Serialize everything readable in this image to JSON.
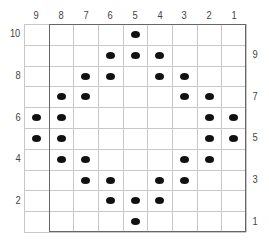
{
  "grid": {
    "rows": 10,
    "cols": 9,
    "column_labels": [
      "9",
      "8",
      "7",
      "6",
      "5",
      "4",
      "3",
      "2",
      "1"
    ],
    "row_labels_left": [
      "10",
      "8",
      "6",
      "4",
      "2"
    ],
    "row_labels_right": [
      "9",
      "7",
      "5",
      "3",
      "1"
    ],
    "dot_color": "#111111",
    "line_color": "#c8c8c8",
    "frame_color": "#666666"
  },
  "dots": [
    {
      "row": 10,
      "cols": [
        "5"
      ]
    },
    {
      "row": 9,
      "cols": [
        "6",
        "5",
        "4"
      ]
    },
    {
      "row": 8,
      "cols": [
        "7",
        "6",
        "4",
        "3"
      ]
    },
    {
      "row": 7,
      "cols": [
        "8",
        "7",
        "3",
        "2"
      ]
    },
    {
      "row": 6,
      "cols": [
        "9",
        "8",
        "2",
        "1"
      ]
    },
    {
      "row": 5,
      "cols": [
        "9",
        "8",
        "2",
        "1"
      ]
    },
    {
      "row": 4,
      "cols": [
        "8",
        "7",
        "3",
        "2"
      ]
    },
    {
      "row": 3,
      "cols": [
        "7",
        "6",
        "4",
        "3"
      ]
    },
    {
      "row": 2,
      "cols": [
        "6",
        "5",
        "4"
      ]
    },
    {
      "row": 1,
      "cols": [
        "5"
      ]
    }
  ]
}
